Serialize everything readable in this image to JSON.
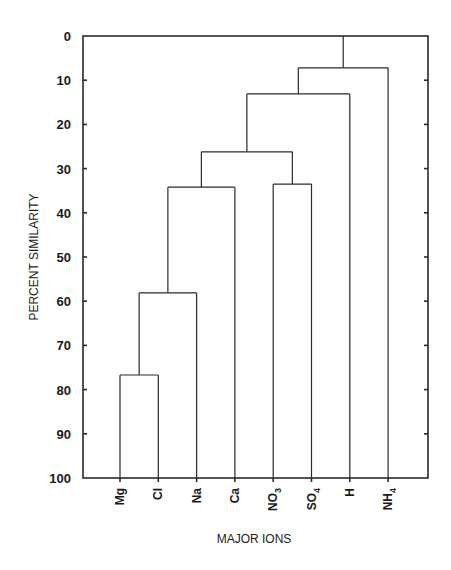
{
  "chart_data": {
    "type": "dendrogram",
    "title": "",
    "xlabel": "MAJOR IONS",
    "ylabel": "PERCENT SIMILARITY",
    "ylim": [
      0,
      100
    ],
    "y_inverted": true,
    "y_ticks": [
      0,
      10,
      20,
      30,
      40,
      50,
      60,
      70,
      80,
      90,
      100
    ],
    "grid": false,
    "categories": [
      {
        "label": "Mg",
        "base": "Mg",
        "sub": ""
      },
      {
        "label": "Cl",
        "base": "Cl",
        "sub": ""
      },
      {
        "label": "Na",
        "base": "Na",
        "sub": ""
      },
      {
        "label": "Ca",
        "base": "Ca",
        "sub": ""
      },
      {
        "label": "NO3",
        "base": "NO",
        "sub": "3"
      },
      {
        "label": "SO4",
        "base": "SO",
        "sub": "4"
      },
      {
        "label": "H",
        "base": "H",
        "sub": ""
      },
      {
        "label": "NH4",
        "base": "NH",
        "sub": "4"
      }
    ],
    "merges": [
      {
        "left": "Mg",
        "right": "Cl",
        "similarity": 76.7
      },
      {
        "left": "Mg+Cl",
        "right": "Na",
        "similarity": 58.1
      },
      {
        "left": "Mg+Cl+Na",
        "right": "Ca",
        "similarity": 34.2
      },
      {
        "left": "NO3",
        "right": "SO4",
        "similarity": 33.5
      },
      {
        "left": "Mg+Cl+Na+Ca",
        "right": "NO3+SO4",
        "similarity": 26.2
      },
      {
        "left": "Mg+Cl+Na+Ca+NO3+SO4",
        "right": "H",
        "similarity": 13.1
      },
      {
        "left": "Mg+Cl+Na+Ca+NO3+SO4+H",
        "right": "NH4",
        "similarity": 7.2
      },
      {
        "left": "root",
        "right": "top",
        "similarity": 0
      }
    ]
  },
  "axis": {
    "y_title": "PERCENT SIMILARITY",
    "x_title": "MAJOR IONS"
  }
}
